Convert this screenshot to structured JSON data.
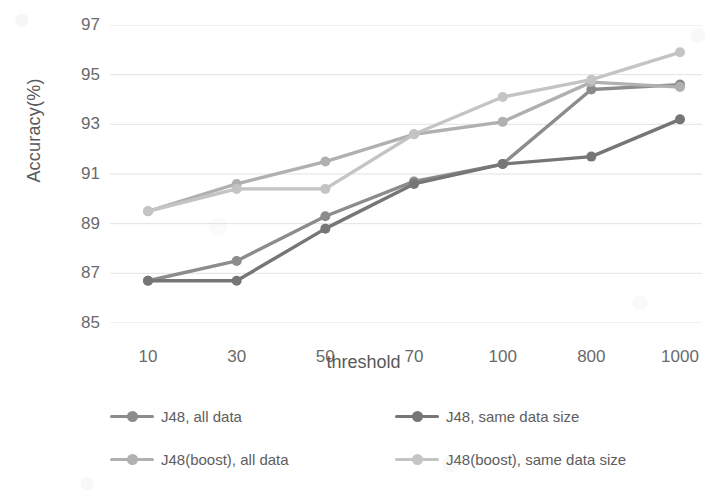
{
  "chart_data": {
    "type": "line",
    "title": "",
    "xlabel": "threshold",
    "ylabel": "Accuracy(%)",
    "categories": [
      "10",
      "30",
      "50",
      "70",
      "100",
      "800",
      "1000"
    ],
    "x_tick_labels": [
      "10",
      "30",
      "50",
      "70",
      "100",
      "800",
      "1000"
    ],
    "y_tick_labels": [
      "97",
      "95",
      "93",
      "91",
      "89",
      "87",
      "85"
    ],
    "y_ticks": [
      97,
      95,
      93,
      91,
      89,
      87,
      85
    ],
    "ylim": [
      85,
      97
    ],
    "grid": "horizontal",
    "legend_position": "bottom",
    "legend_columns": 2,
    "series": [
      {
        "name": "J48, all data",
        "color": "#8c8c8c",
        "values": [
          86.7,
          87.5,
          89.3,
          90.7,
          91.4,
          94.4,
          94.6
        ]
      },
      {
        "name": "J48, same data size",
        "color": "#767676",
        "values": [
          86.7,
          86.7,
          88.8,
          90.6,
          91.4,
          91.7,
          93.2
        ]
      },
      {
        "name": "J48(boost), all data",
        "color": "#b0b0b0",
        "values": [
          89.5,
          90.6,
          91.5,
          92.6,
          93.1,
          94.7,
          94.5
        ]
      },
      {
        "name": "J48(boost), same data size",
        "color": "#c4c4c4",
        "values": [
          89.5,
          90.4,
          90.4,
          92.6,
          94.1,
          94.8,
          95.9
        ]
      }
    ]
  },
  "axes": {
    "x_title": "threshold",
    "y_title": "Accuracy(%)"
  },
  "colors": {
    "gridline": "#e2e2e2",
    "tick_text": "#6a6a6a",
    "axis_text": "#595959",
    "background": "#ffffff"
  }
}
